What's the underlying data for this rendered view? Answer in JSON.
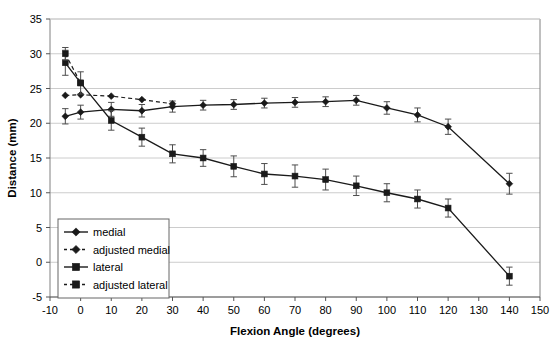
{
  "chart_data": {
    "type": "line",
    "title": "",
    "xlabel": "Flexion Angle (degrees)",
    "ylabel": "Distance (mm)",
    "xlim": [
      -10,
      150
    ],
    "ylim": [
      -5,
      35
    ],
    "xticks": [
      -10,
      0,
      10,
      20,
      30,
      40,
      50,
      60,
      70,
      80,
      90,
      100,
      110,
      120,
      130,
      140,
      150
    ],
    "yticks": [
      -5,
      0,
      5,
      10,
      15,
      20,
      25,
      30,
      35
    ],
    "grid": "horizontal",
    "legend_position": "lower-left-inside",
    "errorbars": true,
    "series": [
      {
        "name": "medial",
        "marker": "diamond",
        "linestyle": "solid",
        "color": "#000000",
        "x": [
          -5,
          0,
          10,
          20,
          30,
          40,
          50,
          60,
          70,
          80,
          90,
          100,
          110,
          120,
          140
        ],
        "y": [
          21.0,
          21.6,
          22.0,
          21.8,
          22.4,
          22.6,
          22.7,
          22.9,
          23.0,
          23.1,
          23.3,
          22.2,
          21.2,
          19.5,
          11.3
        ],
        "err": [
          1.1,
          1.0,
          1.0,
          0.9,
          0.8,
          0.7,
          0.7,
          0.7,
          0.7,
          0.7,
          0.7,
          0.9,
          1.0,
          1.1,
          1.5
        ]
      },
      {
        "name": "adjusted medial",
        "marker": "diamond",
        "linestyle": "dashed",
        "color": "#000000",
        "x": [
          -5,
          0,
          10,
          20,
          30
        ],
        "y": [
          24.0,
          24.1,
          23.9,
          23.4,
          22.8
        ],
        "err": [
          0.0,
          0.0,
          0.0,
          0.0,
          0.0
        ]
      },
      {
        "name": "lateral",
        "marker": "square",
        "linestyle": "solid",
        "color": "#000000",
        "x": [
          -5,
          0,
          10,
          20,
          30,
          40,
          50,
          60,
          70,
          80,
          90,
          100,
          110,
          120,
          140
        ],
        "y": [
          28.7,
          25.8,
          20.4,
          18.0,
          15.6,
          15.0,
          13.8,
          12.7,
          12.4,
          11.9,
          11.0,
          10.0,
          9.1,
          7.8,
          -2.0
        ],
        "err": [
          1.8,
          1.6,
          1.4,
          1.3,
          1.3,
          1.2,
          1.5,
          1.5,
          1.6,
          1.5,
          1.4,
          1.3,
          1.3,
          1.3,
          1.3
        ]
      },
      {
        "name": "adjusted lateral",
        "marker": "square",
        "linestyle": "dashed",
        "color": "#000000",
        "x": [
          -5,
          0
        ],
        "y": [
          30.0,
          25.8
        ],
        "err": [
          0.9,
          0.0
        ]
      }
    ]
  },
  "legend": {
    "items": [
      {
        "label": "medial",
        "marker": "diamond",
        "linestyle": "solid"
      },
      {
        "label": "adjusted medial",
        "marker": "diamond",
        "linestyle": "dashed"
      },
      {
        "label": "lateral",
        "marker": "square",
        "linestyle": "solid"
      },
      {
        "label": "adjusted lateral",
        "marker": "square",
        "linestyle": "dashed"
      }
    ]
  },
  "axes": {
    "x_title": "Flexion Angle (degrees)",
    "y_title": "Distance (mm)",
    "x_tick_labels": [
      "-10",
      "0",
      "10",
      "20",
      "30",
      "40",
      "50",
      "60",
      "70",
      "80",
      "90",
      "100",
      "110",
      "120",
      "130",
      "140",
      "150"
    ],
    "y_tick_labels": [
      "-5",
      "0",
      "5",
      "10",
      "15",
      "20",
      "25",
      "30",
      "35"
    ]
  },
  "colors": {
    "line": "#1a1a1a",
    "grid": "#cccccc",
    "axis": "#808080",
    "text": "#000000",
    "background": "#ffffff"
  }
}
